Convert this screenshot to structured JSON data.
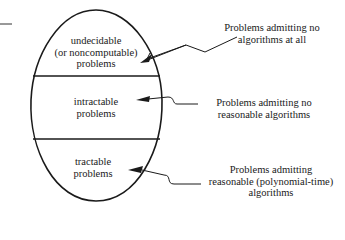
{
  "diagram": {
    "regions": [
      {
        "id": "undecidable",
        "lines": [
          "undecidable",
          "(or noncomputable)",
          "problems"
        ]
      },
      {
        "id": "intractable",
        "lines": [
          "intractable",
          "problems"
        ]
      },
      {
        "id": "tractable",
        "lines": [
          "tractable",
          "problems"
        ]
      }
    ],
    "annotations": [
      {
        "target": "undecidable",
        "lines": [
          "Problems admitting no",
          "algorithms at all"
        ]
      },
      {
        "target": "intractable",
        "lines": [
          "Problems admitting no",
          "reasonable algorithms"
        ]
      },
      {
        "target": "tractable",
        "lines": [
          "Problems admitting",
          "reasonable (polynomial-time)",
          "algorithms"
        ]
      }
    ],
    "colors": {
      "stroke": "#1a1a1a",
      "background": "#ffffff"
    }
  }
}
